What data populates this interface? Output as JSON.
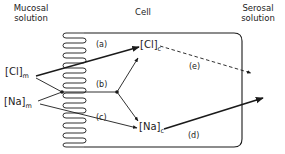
{
  "regions": {
    "mucosal": {
      "line1": "Mucosal",
      "line2": "solution"
    },
    "cell": {
      "label": "Cell"
    },
    "serosal": {
      "line1": "Serosal",
      "line2": "solution"
    }
  },
  "species": {
    "cl_m": {
      "symbol": "[Cl]",
      "sub": "m"
    },
    "na_m": {
      "symbol": "[Na]",
      "sub": "m"
    },
    "cl_c": {
      "symbol": "[Cl]",
      "sub": "c"
    },
    "na_c": {
      "symbol": "[Na]",
      "sub": "c"
    }
  },
  "pathways": {
    "a": "(a)",
    "b": "(b)",
    "c": "(c)",
    "d": "(d)",
    "e": "(e)"
  },
  "colors": {
    "line": "#1a1a1a",
    "background": "#ffffff"
  }
}
